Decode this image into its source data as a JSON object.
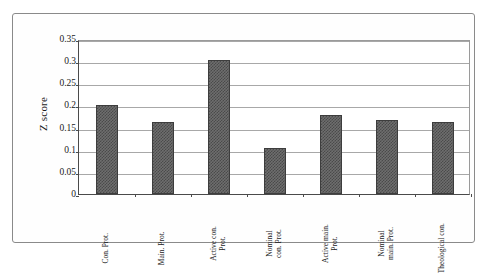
{
  "figure": {
    "border_color": "#8a8a8a",
    "background": "#ffffff"
  },
  "chart_data": {
    "type": "bar",
    "title": "",
    "xlabel": "",
    "ylabel": "Z score",
    "ylim": [
      0,
      0.35
    ],
    "ytick_labels": [
      "0",
      "0.05",
      "0.1",
      "0.15",
      "0.2",
      "0.25",
      "0.3",
      "0.35"
    ],
    "ytick_values": [
      0,
      0.05,
      0.1,
      0.15,
      0.2,
      0.25,
      0.3,
      0.35
    ],
    "grid": true,
    "legend": "none",
    "bar_color": "#6e6e6e",
    "bar_edge_color": "#3d3d3d",
    "categories": [
      "Con. Prot.",
      "Main. Prot.",
      "Active con. Prot.",
      "Nominal con. Prot.",
      "Active main. Prot.",
      "Nominal main. Prot.",
      "Theological con."
    ],
    "values": [
      0.201,
      0.162,
      0.303,
      0.104,
      0.178,
      0.167,
      0.162
    ]
  }
}
